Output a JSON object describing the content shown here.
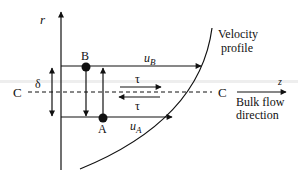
{
  "diagram": {
    "axis_label_r": "r",
    "axis_label_z": "z",
    "point_b_label": "B",
    "point_a_label": "A",
    "velocity_b_label": "u",
    "velocity_b_sub": "B",
    "velocity_a_label": "u",
    "velocity_a_sub": "A",
    "shear_top_label": "τ",
    "shear_bottom_label": "τ",
    "delta_label": "δ",
    "centerline_left_label": "C",
    "centerline_right_label": "C",
    "velocity_profile_line1": "Velocity",
    "velocity_profile_line2": "profile",
    "bulk_flow_line1": "Bulk flow",
    "bulk_flow_line2": "direction",
    "colors": {
      "stroke": "#111111",
      "band": "#ececec"
    }
  }
}
